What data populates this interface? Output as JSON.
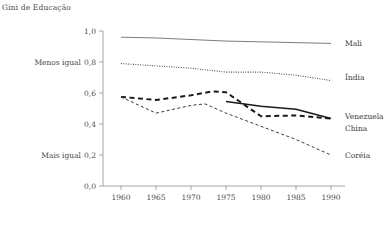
{
  "chart_data": {
    "type": "line",
    "title": "Gini de Educação",
    "xlabel": "",
    "ylabel": "",
    "xlim": [
      1958,
      1992
    ],
    "ylim": [
      0.0,
      1.0
    ],
    "grid": false,
    "legend_position": "right-of-line-ends",
    "x_ticks": [
      1960,
      1965,
      1970,
      1975,
      1980,
      1985,
      1990
    ],
    "x_tick_labels": [
      "1960",
      "1965",
      "1970",
      "1975",
      "1980",
      "1985",
      "1990"
    ],
    "y_ticks": [
      0.0,
      0.2,
      0.4,
      0.6,
      0.8,
      1.0
    ],
    "y_tick_labels": [
      "0,0",
      "0,2",
      "0,4",
      "0,6",
      "0,8",
      "1,0"
    ],
    "y_annotations": [
      {
        "value": 0.8,
        "text": "Menos igual"
      },
      {
        "value": 0.2,
        "text": "Mais igual"
      }
    ],
    "series": [
      {
        "name": "Mali",
        "label": "Mali",
        "style": "solid",
        "color": "#6e6e6e",
        "width": 0.9,
        "dash": "",
        "label_y": 0.92,
        "x": [
          1960,
          1965,
          1970,
          1975,
          1980,
          1985,
          1990
        ],
        "values": [
          0.96,
          0.955,
          0.945,
          0.935,
          0.93,
          0.925,
          0.92
        ]
      },
      {
        "name": "India",
        "label": "Índia",
        "style": "dotted",
        "color": "#3c3c3c",
        "width": 1.1,
        "dash": "0.9 1.5",
        "label_y": 0.7,
        "x": [
          1960,
          1965,
          1970,
          1975,
          1980,
          1985,
          1990
        ],
        "values": [
          0.79,
          0.775,
          0.76,
          0.735,
          0.735,
          0.715,
          0.68
        ]
      },
      {
        "name": "Venezuela",
        "label": "Venezuela",
        "style": "solid",
        "color": "#1a1a1a",
        "width": 1.5,
        "dash": "",
        "label_y": 0.45,
        "x": [
          1975,
          1980,
          1985,
          1990
        ],
        "values": [
          0.545,
          0.515,
          0.495,
          0.435
        ]
      },
      {
        "name": "China",
        "label": "China",
        "style": "dashed",
        "color": "#1a1a1a",
        "width": 2.0,
        "dash": "5 3.5",
        "label_y": 0.37,
        "x": [
          1960,
          1965,
          1970,
          1973,
          1975,
          1980,
          1985,
          1990
        ],
        "values": [
          0.575,
          0.555,
          0.585,
          0.61,
          0.605,
          0.45,
          0.455,
          0.435
        ]
      },
      {
        "name": "Coreia",
        "label": "Coréia",
        "style": "fine-dashed",
        "color": "#3c3c3c",
        "width": 1.0,
        "dash": "3 2.5",
        "label_y": 0.195,
        "x": [
          1960,
          1965,
          1970,
          1972,
          1975,
          1980,
          1985,
          1990
        ],
        "values": [
          0.575,
          0.47,
          0.52,
          0.53,
          0.47,
          0.385,
          0.3,
          0.2
        ]
      }
    ]
  }
}
